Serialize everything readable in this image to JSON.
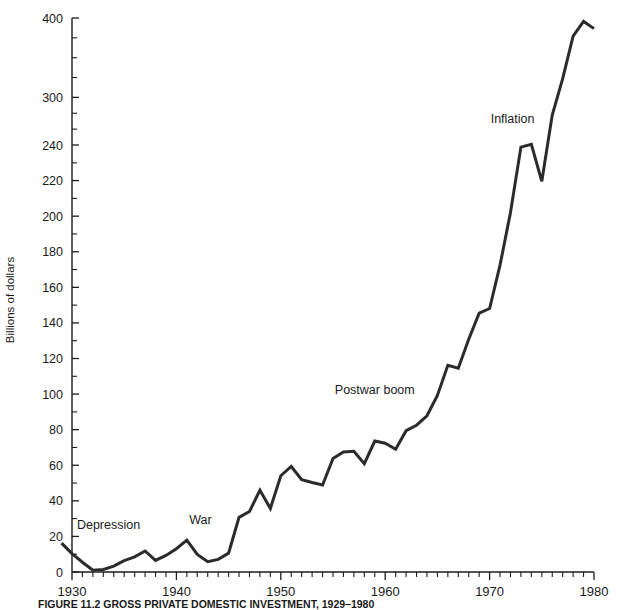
{
  "figure": {
    "caption": "FIGURE 11.2 GROSS PRIVATE DOMESTIC INVESTMENT, 1929–1980",
    "ylabel": "Billions of dollars"
  },
  "chart_data": {
    "type": "line",
    "title": "FIGURE 11.2 GROSS PRIVATE DOMESTIC INVESTMENT, 1929–1980",
    "xlabel": "",
    "ylabel": "Billions of dollars",
    "xlim": [
      1929,
      1980
    ],
    "ylim": [
      0,
      400
    ],
    "grid": false,
    "legend": "none",
    "axis_note": "y-axis uses a broken / compressed scale above 240",
    "ytick_labels": [
      "0",
      "20",
      "40",
      "60",
      "80",
      "100",
      "120",
      "140",
      "160",
      "180",
      "200",
      "220",
      "240",
      "300",
      "400"
    ],
    "ytick_values": [
      0,
      20,
      40,
      60,
      80,
      100,
      120,
      140,
      160,
      180,
      200,
      220,
      240,
      300,
      400
    ],
    "yminor_values": [
      10,
      30,
      50,
      70,
      90,
      110,
      130,
      150,
      170,
      190,
      210,
      230,
      260,
      280,
      325,
      350,
      375
    ],
    "xtick_labels": [
      "1930",
      "1940",
      "1950",
      "1960",
      "1970",
      "1980"
    ],
    "xtick_values": [
      1930,
      1940,
      1950,
      1960,
      1970,
      1980
    ],
    "series": [
      {
        "name": "Gross private domestic investment",
        "color": "#2b2b2b",
        "x": [
          1929,
          1930,
          1931,
          1932,
          1933,
          1934,
          1935,
          1936,
          1937,
          1938,
          1939,
          1940,
          1941,
          1942,
          1943,
          1944,
          1945,
          1946,
          1947,
          1948,
          1949,
          1950,
          1951,
          1952,
          1953,
          1954,
          1955,
          1956,
          1957,
          1958,
          1959,
          1960,
          1961,
          1962,
          1963,
          1964,
          1965,
          1966,
          1967,
          1968,
          1969,
          1970,
          1971,
          1972,
          1973,
          1974,
          1975,
          1976,
          1977,
          1978,
          1979,
          1980
        ],
        "values": [
          16.2,
          10.3,
          5.5,
          1.0,
          1.4,
          3.3,
          6.4,
          8.5,
          11.8,
          6.5,
          9.3,
          13.1,
          17.9,
          9.9,
          5.8,
          7.1,
          10.6,
          30.7,
          34.0,
          46.0,
          35.7,
          54.1,
          59.3,
          51.9,
          50.3,
          48.9,
          63.8,
          67.4,
          67.8,
          60.9,
          73.6,
          72.4,
          69.0,
          79.4,
          82.5,
          87.8,
          99.2,
          116.2,
          114.5,
          130.8,
          145.5,
          148.1,
          172.5,
          202.0,
          238.8,
          240.8,
          219.6,
          277.7,
          323.6,
          377.2,
          395.7,
          386.6
        ]
      }
    ],
    "annotations": [
      {
        "label": "Depression",
        "x": 1933.5,
        "y": 24
      },
      {
        "label": "War",
        "x": 1942.3,
        "y": 27
      },
      {
        "label": "Postwar boom",
        "x": 1959.0,
        "y": 100
      },
      {
        "label": "Inflation",
        "x": 1972.2,
        "y": 268
      }
    ]
  }
}
